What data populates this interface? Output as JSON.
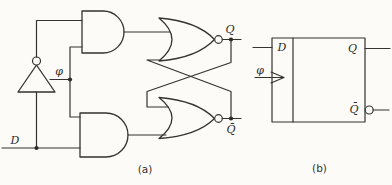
{
  "figure": {
    "type": "logic-circuit-diagram",
    "background": "#fcfbf8",
    "ink": "#35332f",
    "panel_a": {
      "caption": "(a)",
      "labels": {
        "d": "D",
        "phi": "φ",
        "q": "Q",
        "qbar": "Q̄"
      },
      "components": [
        "not-gate",
        "and-gate-top",
        "and-gate-bottom",
        "nor-gate-top",
        "nor-gate-bottom"
      ],
      "inputs": [
        "D",
        "φ"
      ],
      "outputs": [
        "Q",
        "Q̄"
      ]
    },
    "panel_b": {
      "caption": "(b)",
      "labels": {
        "d": "D",
        "phi": "φ",
        "q": "Q",
        "qbar": "Q̄"
      },
      "components": [
        "d-latch-block",
        "clock-input-arrowhead",
        "inverted-output-bubble"
      ],
      "inputs": [
        "D",
        "φ"
      ],
      "outputs": [
        "Q",
        "Q̄"
      ]
    }
  }
}
